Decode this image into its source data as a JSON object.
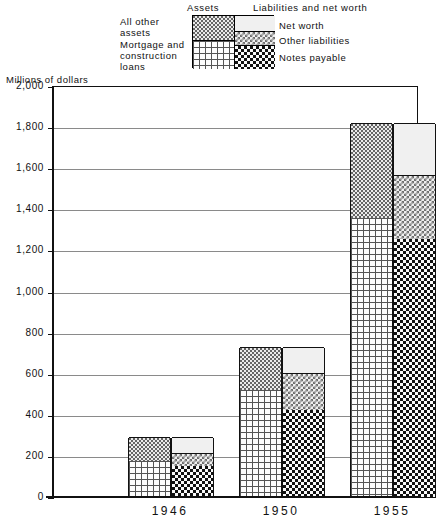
{
  "legend": {
    "heading_assets": "Assets",
    "heading_liabilities": "Liabilities and net worth",
    "assets_items": [
      {
        "label": "All other\nassets",
        "pattern": "dots"
      },
      {
        "label": "Mortgage and\nconstruction\nloans",
        "pattern": "brick"
      }
    ],
    "liability_items": [
      {
        "label": "Net worth",
        "pattern": "fine-dots"
      },
      {
        "label": "Other liabilities",
        "pattern": "check-light"
      },
      {
        "label": "Notes payable",
        "pattern": "check-dark"
      }
    ]
  },
  "axis": {
    "y_title": "Millions of dollars",
    "y_ticks": [
      "2,000",
      "1,800",
      "1,600",
      "1,400",
      "1,200",
      "1,000",
      "800",
      "600",
      "400",
      "200",
      "0"
    ],
    "x_ticks": [
      "1946",
      "1950",
      "1955"
    ]
  },
  "chart_data": {
    "type": "bar",
    "title": "",
    "subtitle": "",
    "xlabel": "",
    "ylabel": "Millions of dollars",
    "ylim": [
      0,
      2000
    ],
    "ytick_step": 200,
    "grid": true,
    "legend_position": "top",
    "stacked": true,
    "paired_bars": true,
    "categories": [
      "1946",
      "1950",
      "1955"
    ],
    "pair_names": [
      "Assets",
      "Liabilities and net worth"
    ],
    "series": [
      {
        "name": "Mortgage and construction loans",
        "group": "Assets",
        "pattern": "brick",
        "values": [
          175,
          520,
          1360
        ]
      },
      {
        "name": "All other assets",
        "group": "Assets",
        "pattern": "dots",
        "values": [
          115,
          210,
          460
        ]
      },
      {
        "name": "Notes payable",
        "group": "Liabilities and net worth",
        "pattern": "check-dark",
        "values": [
          150,
          425,
          1255
        ]
      },
      {
        "name": "Other liabilities",
        "group": "Liabilities and net worth",
        "pattern": "check-light",
        "values": [
          65,
          180,
          310
        ]
      },
      {
        "name": "Net worth",
        "group": "Liabilities and net worth",
        "pattern": "fine-dots",
        "values": [
          75,
          125,
          255
        ]
      }
    ],
    "totals": {
      "Assets": [
        290,
        730,
        1820
      ],
      "Liabilities and net worth": [
        290,
        730,
        1820
      ]
    }
  }
}
